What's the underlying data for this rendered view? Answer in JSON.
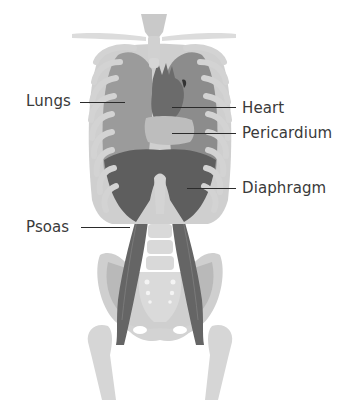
{
  "diagram": {
    "title": "",
    "colors": {
      "background": "#ffffff",
      "bone": "#d6d6d6",
      "bone_shadow": "#c4c4c4",
      "lung": "#9b9b9b",
      "lung_dark": "#8a8a8a",
      "heart": "#6d6d6d",
      "pericardium": "#bdbdbd",
      "diaphragm": "#5f5f5f",
      "psoas": "#666666",
      "label_text": "#3a3a3a",
      "leader_line": "#2b2b2b"
    },
    "labels": [
      {
        "id": "lungs",
        "text": "Lungs",
        "side": "left",
        "x": 26,
        "y": 92,
        "line": {
          "x1": 80,
          "x2": 125,
          "y": 102
        }
      },
      {
        "id": "heart",
        "text": "Heart",
        "side": "right",
        "x": 242,
        "y": 100,
        "line": {
          "x1": 172,
          "x2": 236,
          "y": 108
        }
      },
      {
        "id": "pericardium",
        "text": "Pericardium",
        "side": "right",
        "x": 242,
        "y": 125,
        "line": {
          "x1": 172,
          "x2": 236,
          "y": 133
        }
      },
      {
        "id": "diaphragm",
        "text": "Diaphragm",
        "side": "right",
        "x": 242,
        "y": 179,
        "line": {
          "x1": 187,
          "x2": 236,
          "y": 188
        }
      },
      {
        "id": "psoas",
        "text": "Psoas",
        "side": "left",
        "x": 26,
        "y": 218,
        "line": {
          "x1": 81,
          "x2": 130,
          "y": 227
        }
      }
    ]
  }
}
